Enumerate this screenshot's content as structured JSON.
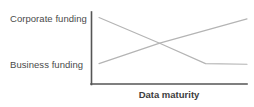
{
  "chart_data": {
    "type": "line",
    "title": "",
    "subtitle": "",
    "xlabel": "Data maturity",
    "ylabel": "",
    "grid": false,
    "legend_position": "none",
    "axis_ticks": "none",
    "y_category_labels": [
      "Corporate funding",
      "Business funding"
    ],
    "x": [
      0,
      0.41,
      0.72,
      1
    ],
    "xlim": [
      0,
      1
    ],
    "ylim": [
      0,
      1
    ],
    "series": [
      {
        "name": "Corporate funding",
        "description": "descending line that levels off into a plateau at high data maturity",
        "x": [
          0,
          0.41,
          0.72,
          1
        ],
        "values": [
          0.96,
          0.56,
          0.24,
          0.23
        ],
        "color": "#b4b4b4"
      },
      {
        "name": "Business funding",
        "description": "steadily ascending line crossing the corporate funding line",
        "x": [
          0,
          0.41,
          1
        ],
        "values": [
          0.24,
          0.56,
          0.94
        ],
        "color": "#b4b4b4"
      }
    ],
    "annotations": [
      {
        "name": "crossover-point",
        "x": 0.41,
        "y": 0.56,
        "label": ""
      }
    ],
    "colors": {
      "axis": "#555555",
      "line": "#b4b4b4",
      "label_text": "#4a4a4a",
      "xlabel_text": "#3d3d3d",
      "background": "#ffffff"
    }
  },
  "axes": {
    "x_axis_label": "Data maturity",
    "y_top_label": "Corporate funding",
    "y_bottom_label": "Business funding"
  }
}
